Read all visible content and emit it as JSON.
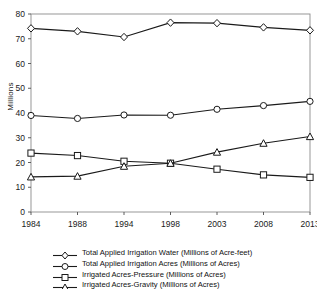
{
  "chart_data": {
    "type": "line",
    "title": "",
    "subtitle": "",
    "xlabel": "",
    "ylabel": "Millions",
    "categories": [
      "1984",
      "1988",
      "1994",
      "1998",
      "2003",
      "2008",
      "2013"
    ],
    "ylim": [
      0,
      80
    ],
    "yticks": [
      0,
      10,
      20,
      30,
      40,
      50,
      60,
      70,
      80
    ],
    "grid": false,
    "legend_position": "bottom",
    "series": [
      {
        "name": "Total Applied Irrigation Water (Millions of Acre-feet)",
        "marker": "diamond",
        "color": "#1a1a1a",
        "values": [
          74.2,
          73.0,
          70.7,
          76.5,
          76.3,
          74.6,
          73.4
        ]
      },
      {
        "name": "Total Applied Irrigation Acres (Millions of Acres)",
        "marker": "circle",
        "color": "#1a1a1a",
        "values": [
          39.0,
          37.8,
          39.2,
          39.1,
          41.5,
          43.0,
          44.7
        ]
      },
      {
        "name": "Irrigated Acres-Pressure (Millions of Acres)",
        "marker": "square",
        "color": "#1a1a1a",
        "values": [
          23.8,
          22.8,
          20.5,
          19.7,
          17.3,
          15.0,
          14.0
        ]
      },
      {
        "name": "Irrigated Acres-Gravity (Millions of Acres)",
        "marker": "triangle",
        "color": "#1a1a1a",
        "values": [
          14.2,
          14.5,
          18.5,
          19.7,
          24.2,
          27.8,
          30.5
        ]
      }
    ]
  }
}
